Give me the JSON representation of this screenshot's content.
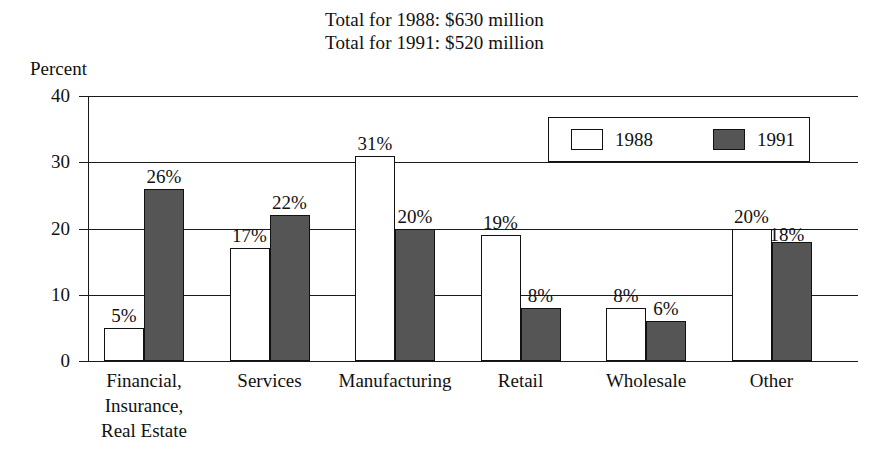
{
  "header": {
    "line1": "Total for 1988:  $630 million",
    "line2": "Total for 1991:  $520 million"
  },
  "axis": {
    "y_caption": "Percent"
  },
  "legend": {
    "items": [
      {
        "label": "1988",
        "swatch": "white-swatch-icon",
        "color": "#ffffff"
      },
      {
        "label": "1991",
        "swatch": "gray-swatch-icon",
        "color": "#555555"
      }
    ]
  },
  "chart_data": {
    "type": "bar",
    "xlabel": "",
    "ylabel": "Percent",
    "ylim": [
      0,
      40
    ],
    "yticks": [
      0,
      10,
      20,
      30,
      40
    ],
    "ytick_labels": [
      "0",
      "10",
      "20",
      "30",
      "40"
    ],
    "grid": true,
    "legend_position": "upper right",
    "categories": [
      "Financial,\nInsurance,\nReal Estate",
      "Services",
      "Manufacturing",
      "Retail",
      "Wholesale",
      "Other"
    ],
    "category_lines": [
      [
        "Financial,",
        "Insurance,",
        "Real Estate"
      ],
      [
        "Services"
      ],
      [
        "Manufacturing"
      ],
      [
        "Retail"
      ],
      [
        "Wholesale"
      ],
      [
        "Other"
      ]
    ],
    "series": [
      {
        "name": "1988",
        "color": "#ffffff",
        "values": [
          5,
          17,
          31,
          19,
          8,
          20
        ],
        "labels": [
          "5%",
          "17%",
          "31%",
          "19%",
          "8%",
          "20%"
        ]
      },
      {
        "name": "1991",
        "color": "#555555",
        "values": [
          26,
          22,
          20,
          8,
          6,
          18
        ],
        "labels": [
          "26%",
          "22%",
          "20%",
          "8%",
          "6%",
          "18%"
        ]
      }
    ]
  }
}
